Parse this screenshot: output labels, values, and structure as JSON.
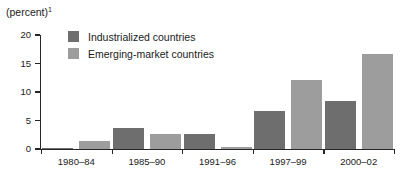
{
  "chart_data": {
    "type": "bar",
    "title": "(percent)",
    "title_superscript": "1",
    "xlabel": "",
    "ylabel": "",
    "ylim": [
      0,
      20
    ],
    "yticks": [
      0,
      5,
      10,
      15,
      20
    ],
    "ytick_labels": [
      "0",
      "5",
      "10",
      "15",
      "20"
    ],
    "grid": false,
    "legend_position": "top-left-inside",
    "categories": [
      "1980–84",
      "1985–90",
      "1991–96",
      "1997–99",
      "2000–02"
    ],
    "series": [
      {
        "name": "Industrialized countries",
        "color": "#6e6e6e",
        "values": [
          0.1,
          3.7,
          2.7,
          6.7,
          8.5
        ]
      },
      {
        "name": "Emerging-market countries",
        "color": "#9d9d9d",
        "values": [
          1.4,
          2.6,
          0.4,
          12.1,
          16.7
        ]
      }
    ]
  },
  "colors": {
    "series_industrialized": "#6e6e6e",
    "series_emerging": "#9d9d9d",
    "axis": "#262626",
    "text": "#1a1a1a",
    "background": "#ffffff"
  }
}
